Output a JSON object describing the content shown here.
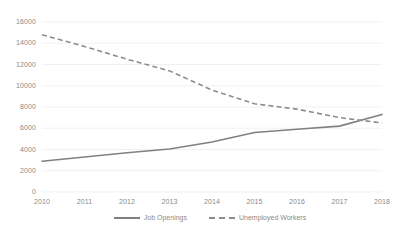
{
  "chart_data": {
    "type": "line",
    "title": "",
    "subtitle": "",
    "xlabel": "",
    "ylabel": "",
    "x": [
      "2010",
      "2011",
      "2012",
      "2013",
      "2014",
      "2015",
      "2016",
      "2017",
      "2018"
    ],
    "categories": [
      "2010",
      "2011",
      "2012",
      "2013",
      "2014",
      "2015",
      "2016",
      "2017",
      "2018"
    ],
    "series": [
      {
        "name": "Job Openings",
        "style": "solid",
        "color": "#808080",
        "values": [
          2900,
          3300,
          3700,
          4050,
          4700,
          5600,
          5900,
          6200,
          7300
        ]
      },
      {
        "name": "Unemployed Workers",
        "style": "dashed",
        "color": "#8c8c8c",
        "values": [
          14800,
          13700,
          12500,
          11400,
          9600,
          8300,
          7800,
          7000,
          6500
        ]
      }
    ],
    "ylim": [
      0,
      16000
    ],
    "yticks": [
      0,
      2000,
      4000,
      6000,
      8000,
      10000,
      12000,
      14000,
      16000
    ],
    "ytick_labels": [
      "0",
      "2000",
      "4000",
      "6000",
      "8000",
      "10000",
      "12000",
      "14000",
      "16000"
    ],
    "xtick_labels": [
      "2010",
      "2011",
      "2012",
      "2013",
      "2014",
      "2015",
      "2016",
      "2017",
      "2018"
    ],
    "grid": "horizontal",
    "grid_color": "#e8e8e8",
    "legend_position": "bottom-center",
    "legend": [
      "Job Openings",
      "Unemployed Workers"
    ],
    "annotations": []
  },
  "legend": {
    "items": [
      {
        "label": "Job Openings"
      },
      {
        "label": "Unemployed Workers"
      }
    ]
  }
}
